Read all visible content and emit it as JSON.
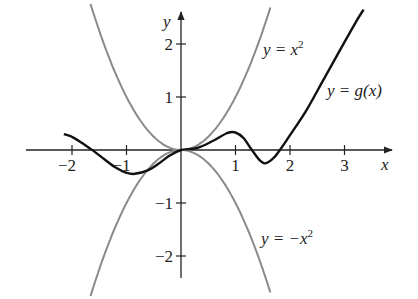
{
  "chart_data": {
    "type": "line",
    "title": "",
    "xlabel": "x",
    "ylabel": "y",
    "xlim": [
      -2.8,
      3.8
    ],
    "ylim": [
      -2.4,
      2.6
    ],
    "x_ticks": [
      -2,
      -1,
      1,
      2,
      3
    ],
    "x_tick_labels": [
      "−2",
      "−1",
      "1",
      "2",
      "3"
    ],
    "y_ticks": [
      2,
      1,
      -1,
      -2
    ],
    "y_tick_labels": [
      "2",
      "1",
      "−1",
      "−2"
    ],
    "grid": false,
    "series": [
      {
        "name": "y = x^2",
        "label": "y = x",
        "label_sup": "2",
        "color": "#8a8a8a",
        "function": "x^2",
        "x": [
          -1.6,
          -1.2,
          -0.8,
          -0.4,
          0,
          0.4,
          0.8,
          1.2,
          1.6
        ],
        "y": [
          2.56,
          1.44,
          0.64,
          0.16,
          0,
          0.16,
          0.64,
          1.44,
          2.56
        ]
      },
      {
        "name": "y = -x^2",
        "label": "y = −x",
        "label_sup": "2",
        "color": "#8a8a8a",
        "function": "-x^2",
        "x": [
          -1.6,
          -1.2,
          -0.8,
          -0.4,
          0,
          0.4,
          0.8,
          1.2,
          1.6
        ],
        "y": [
          -2.56,
          -1.44,
          -0.64,
          -0.16,
          0,
          -0.16,
          -0.64,
          -1.44,
          -2.56
        ]
      },
      {
        "name": "y = g(x)",
        "label": "y = g(x)",
        "color": "#111111",
        "x": [
          -2.15,
          -2.0,
          -1.8,
          -1.6,
          -1.4,
          -1.2,
          -1.0,
          -0.85,
          -0.6,
          -0.4,
          -0.2,
          0,
          0.3,
          0.6,
          0.85,
          1.0,
          1.15,
          1.3,
          1.45,
          1.55,
          1.7,
          1.85,
          2.0,
          2.3,
          2.6,
          2.9,
          3.2,
          3.35
        ],
        "y": [
          0.3,
          0.25,
          0.12,
          -0.02,
          -0.18,
          -0.33,
          -0.43,
          -0.45,
          -0.38,
          -0.25,
          -0.1,
          0,
          0.04,
          0.18,
          0.32,
          0.33,
          0.22,
          0.0,
          -0.2,
          -0.25,
          -0.15,
          0.05,
          0.28,
          0.75,
          1.3,
          1.85,
          2.4,
          2.65
        ]
      }
    ]
  }
}
